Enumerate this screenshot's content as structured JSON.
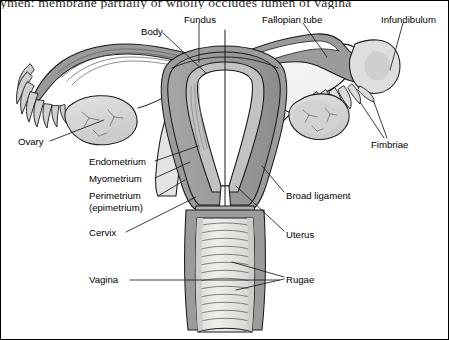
{
  "figure": {
    "title_fragment": "ymen: membrane partially or wholly occludes lumen of vagina",
    "kind": "anatomical-line-drawing",
    "border_color": "#000000",
    "palette": {
      "outline": "#1a1a1a",
      "tube_wall": "#8e8e8e",
      "uterus_wall": "#9a9a9a",
      "endometrium": "#b9b9b9",
      "cavity": "#ffffff",
      "broad_ligament": "#f0f0f0",
      "ovary": "#d8d8d8",
      "vagina_canal": "#e8e6e2",
      "vagina_wall": "#9b9b9b",
      "leader_line": "#1a1a1a",
      "background": "#ffffff"
    }
  },
  "labels": [
    {
      "id": "body",
      "text": "Body",
      "x": 141,
      "y": 26
    },
    {
      "id": "fundus",
      "text": "Fundus",
      "x": 184,
      "y": 14
    },
    {
      "id": "fallopian",
      "text": "Fallopian tube",
      "x": 262,
      "y": 14
    },
    {
      "id": "infundibulum",
      "text": "Infundibulum",
      "x": 381,
      "y": 14
    },
    {
      "id": "ovary",
      "text": "Ovary",
      "x": 18,
      "y": 138
    },
    {
      "id": "endometrium",
      "text": "Endometrium",
      "x": 89,
      "y": 157
    },
    {
      "id": "myometrium",
      "text": "Myometrium",
      "x": 89,
      "y": 174
    },
    {
      "id": "perimetrium",
      "text": "Perimetrium (epimetrium)",
      "x": 89,
      "y": 192
    },
    {
      "id": "cervix",
      "text": "Cervix",
      "x": 89,
      "y": 229
    },
    {
      "id": "vagina",
      "text": "Vagina",
      "x": 89,
      "y": 277
    },
    {
      "id": "fimbriae",
      "text": "Fimbriae",
      "x": 371,
      "y": 141
    },
    {
      "id": "broad_ligament",
      "text": "Broad ligament",
      "x": 286,
      "y": 193
    },
    {
      "id": "uterus",
      "text": "Uterus",
      "x": 286,
      "y": 233
    },
    {
      "id": "rugae",
      "text": "Rugae",
      "x": 286,
      "y": 277
    }
  ]
}
